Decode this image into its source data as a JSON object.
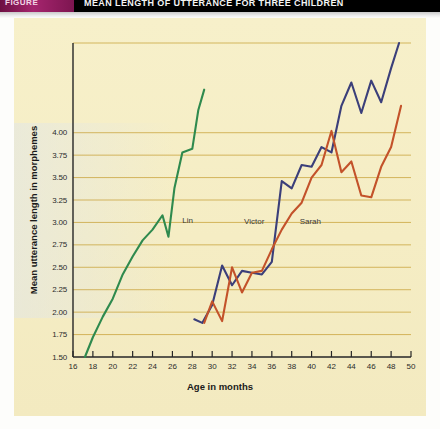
{
  "caption": {
    "figure_chip": "FIGURE",
    "title": "MEAN LENGTH OF UTTERANCE FOR THREE CHILDREN"
  },
  "chart_data": {
    "type": "line",
    "title": "",
    "xlabel": "Age in months",
    "ylabel": "Mean utterance length in morphemes",
    "xlim": [
      16,
      50
    ],
    "ylim": [
      1.5,
      5.0
    ],
    "xticks": [
      16,
      18,
      20,
      22,
      24,
      26,
      28,
      30,
      32,
      34,
      36,
      38,
      40,
      42,
      44,
      46,
      48,
      50
    ],
    "xtick_labels": [
      "16",
      "18",
      "20",
      "22",
      "24",
      "26",
      "28",
      "30",
      "32",
      "34",
      "36",
      "38",
      "40",
      "42",
      "44",
      "46",
      "48",
      "50"
    ],
    "yticks": [
      1.5,
      1.75,
      2.0,
      2.25,
      2.5,
      2.75,
      3.0,
      3.25,
      3.5,
      3.75,
      4.0
    ],
    "ytick_labels": [
      "1.50",
      "1.75",
      "2.00",
      "2.25",
      "2.50",
      "2.75",
      "3.00",
      "3.25",
      "3.50",
      "3.75",
      "4.00"
    ],
    "grid": true,
    "grid_color": "#c9a43c",
    "background": "#f5edc4",
    "legend": "inline-labels",
    "series": [
      {
        "name": "Lin",
        "color": "#2f8a4e",
        "label_x": 27.0,
        "label_y": 3.02,
        "x": [
          17.2,
          18.0,
          19.0,
          20.0,
          21.0,
          22.0,
          23.0,
          24.0,
          25.0,
          25.6,
          26.2,
          27.0,
          28.0,
          28.6,
          29.2
        ],
        "y": [
          1.5,
          1.72,
          1.95,
          2.15,
          2.42,
          2.62,
          2.8,
          2.92,
          3.08,
          2.84,
          3.38,
          3.78,
          3.82,
          4.25,
          4.48
        ]
      },
      {
        "name": "Victor",
        "color": "#3b3f7a",
        "label_x": 33.2,
        "label_y": 3.0,
        "x": [
          28.2,
          29.0,
          30.0,
          31.0,
          32.0,
          33.0,
          34.0,
          35.0,
          36.0,
          37.0,
          38.0,
          39.0,
          40.0,
          41.0,
          42.0,
          43.0,
          44.0,
          45.0,
          46.0,
          47.0,
          48.0,
          48.8
        ],
        "y": [
          1.92,
          1.88,
          2.08,
          2.52,
          2.3,
          2.46,
          2.44,
          2.42,
          2.56,
          3.46,
          3.38,
          3.64,
          3.62,
          3.84,
          3.78,
          4.3,
          4.56,
          4.22,
          4.58,
          4.34,
          4.72,
          5.0
        ]
      },
      {
        "name": "Sarah",
        "color": "#c3522a",
        "label_x": 38.8,
        "label_y": 3.0,
        "x": [
          29.2,
          30.0,
          31.0,
          32.0,
          33.0,
          34.0,
          35.0,
          36.0,
          37.0,
          38.0,
          39.0,
          40.0,
          41.0,
          42.0,
          43.0,
          44.0,
          45.0,
          46.0,
          47.0,
          48.0,
          49.0
        ],
        "y": [
          1.88,
          2.12,
          1.9,
          2.5,
          2.22,
          2.44,
          2.46,
          2.7,
          2.92,
          3.1,
          3.22,
          3.5,
          3.64,
          4.02,
          3.56,
          3.68,
          3.3,
          3.28,
          3.62,
          3.84,
          4.3
        ]
      }
    ]
  }
}
